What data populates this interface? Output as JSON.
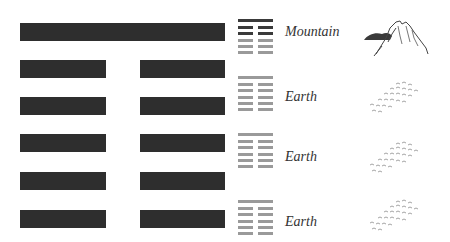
{
  "hexagram": {
    "lines_top_to_bottom": [
      {
        "type": "solid"
      },
      {
        "type": "broken"
      },
      {
        "type": "broken"
      },
      {
        "type": "broken"
      },
      {
        "type": "broken"
      },
      {
        "type": "broken"
      }
    ],
    "line_color": "#2e2e2e"
  },
  "trigram_rows": [
    {
      "label": "Mountain",
      "icon": "mountain-icon",
      "symbol": {
        "top": "solid",
        "colors": [
          "#3a3a3a",
          "#3a3a3a",
          "#3a3a3a",
          "#9a9a9a",
          "#9a9a9a",
          "#9a9a9a"
        ],
        "types": [
          "solid",
          "broken",
          "broken",
          "broken",
          "broken",
          "broken"
        ]
      }
    },
    {
      "label": "Earth",
      "icon": "earth-field-icon",
      "symbol": {
        "colors": [
          "#9a9a9a",
          "#9a9a9a",
          "#9a9a9a",
          "#9a9a9a",
          "#9a9a9a",
          "#9a9a9a"
        ],
        "types": [
          "solid",
          "broken",
          "broken",
          "broken",
          "broken",
          "broken"
        ]
      }
    },
    {
      "label": "Earth",
      "icon": "earth-field-icon",
      "symbol": {
        "colors": [
          "#9a9a9a",
          "#9a9a9a",
          "#9a9a9a",
          "#9a9a9a",
          "#9a9a9a",
          "#9a9a9a"
        ],
        "types": [
          "solid",
          "broken",
          "broken",
          "broken",
          "broken",
          "broken"
        ]
      }
    },
    {
      "label": "Earth",
      "icon": "earth-field-icon",
      "symbol": {
        "colors": [
          "#9a9a9a",
          "#9a9a9a",
          "#9a9a9a",
          "#9a9a9a",
          "#9a9a9a",
          "#9a9a9a"
        ],
        "types": [
          "solid",
          "broken",
          "broken",
          "broken",
          "broken",
          "broken"
        ]
      }
    }
  ]
}
